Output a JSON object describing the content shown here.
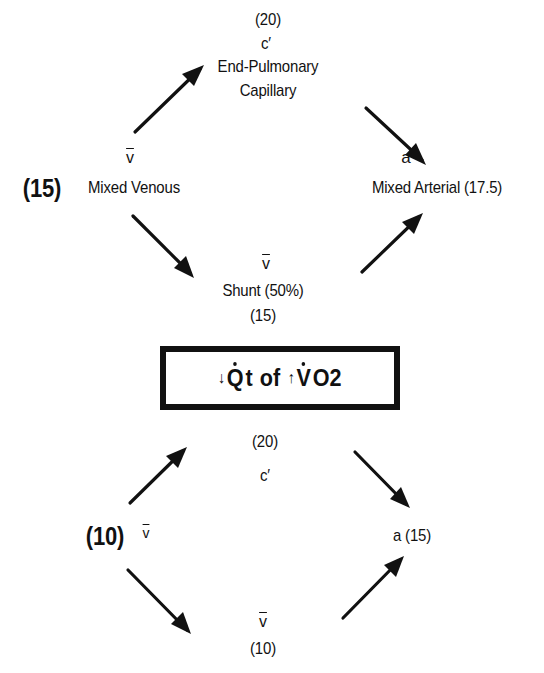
{
  "diagram": {
    "top_panel": {
      "capillary": {
        "value": "(20)",
        "symbol": "c′",
        "label_line1": "End-Pulmonary",
        "label_line2": "Capillary"
      },
      "mixed_venous": {
        "symbol": "v",
        "value": "(15)",
        "label": "Mixed Venous"
      },
      "mixed_arterial": {
        "symbol": "a",
        "label": "Mixed Arterial (17.5)"
      },
      "shunt": {
        "symbol": "v",
        "label": "Shunt (50%)",
        "value": "(15)"
      }
    },
    "title_box": {
      "down_arrow": "↓",
      "qt": "Q",
      "qt_suffix": "t",
      "of": "of",
      "up_arrow": "↑",
      "vo2": "V",
      "vo2_suffix": "O2"
    },
    "bottom_panel": {
      "capillary": {
        "value": "(20)",
        "symbol": "c′"
      },
      "mixed_venous": {
        "value": "(10)",
        "symbol": "v"
      },
      "arterial": {
        "label": "a (15)"
      },
      "shunt": {
        "symbol": "v",
        "value": "(10)"
      }
    }
  }
}
